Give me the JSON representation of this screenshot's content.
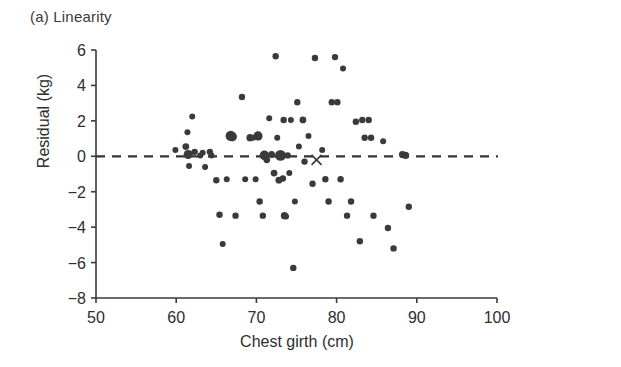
{
  "figure": {
    "panel_label": "(a) Linearity",
    "background_color": "#ffffff",
    "ink_color": "#333333"
  },
  "chart_data": {
    "type": "scatter",
    "title": "(a) Linearity",
    "xlabel": "Chest girth (cm)",
    "ylabel": "Residual (kg)",
    "xlim": [
      50,
      100
    ],
    "ylim": [
      -8,
      6
    ],
    "xticks": [
      50,
      60,
      70,
      80,
      90,
      100
    ],
    "yticks": [
      -8,
      -6,
      -4,
      -2,
      0,
      2,
      4,
      6
    ],
    "xtick_labels": [
      "50",
      "60",
      "70",
      "80",
      "90",
      "100"
    ],
    "ytick_labels": [
      "−8",
      "−6",
      "−4",
      "−2",
      "0",
      "2",
      "4",
      "6"
    ],
    "grid": false,
    "legend": null,
    "reference_line": {
      "kind": "horizontal",
      "y": 0,
      "style": "dashed",
      "color": "#333333"
    },
    "marker_color": "#3a3a3a",
    "series": [
      {
        "name": "residuals",
        "marker": "circle",
        "points": [
          {
            "x": 59.9,
            "y": 0.35,
            "size": 3.0
          },
          {
            "x": 61.2,
            "y": 0.55,
            "size": 3.4
          },
          {
            "x": 61.4,
            "y": 1.35,
            "size": 3.0
          },
          {
            "x": 61.5,
            "y": 0.1,
            "size": 4.6
          },
          {
            "x": 61.6,
            "y": -0.55,
            "size": 3.0
          },
          {
            "x": 62.0,
            "y": 2.25,
            "size": 3.0
          },
          {
            "x": 62.3,
            "y": 0.25,
            "size": 3.2
          },
          {
            "x": 63.0,
            "y": 0.05,
            "size": 3.0
          },
          {
            "x": 63.3,
            "y": 0.2,
            "size": 3.0
          },
          {
            "x": 63.6,
            "y": -0.6,
            "size": 3.0
          },
          {
            "x": 64.2,
            "y": 0.25,
            "size": 3.2
          },
          {
            "x": 64.4,
            "y": 0.05,
            "size": 3.0
          },
          {
            "x": 65.0,
            "y": -1.35,
            "size": 3.2
          },
          {
            "x": 65.4,
            "y": -3.3,
            "size": 3.2
          },
          {
            "x": 65.8,
            "y": -4.95,
            "size": 3.0
          },
          {
            "x": 66.3,
            "y": -1.3,
            "size": 3.0
          },
          {
            "x": 66.8,
            "y": 1.15,
            "size": 5.2
          },
          {
            "x": 67.0,
            "y": 1.1,
            "size": 4.6
          },
          {
            "x": 67.4,
            "y": -3.35,
            "size": 3.2
          },
          {
            "x": 68.2,
            "y": 3.35,
            "size": 3.2
          },
          {
            "x": 68.6,
            "y": -1.3,
            "size": 3.0
          },
          {
            "x": 69.2,
            "y": 1.05,
            "size": 3.6
          },
          {
            "x": 69.6,
            "y": 1.05,
            "size": 3.0
          },
          {
            "x": 69.9,
            "y": -1.3,
            "size": 3.0
          },
          {
            "x": 70.2,
            "y": 1.15,
            "size": 4.6
          },
          {
            "x": 70.4,
            "y": -2.55,
            "size": 3.2
          },
          {
            "x": 70.8,
            "y": -3.35,
            "size": 3.2
          },
          {
            "x": 71.0,
            "y": 0.05,
            "size": 4.8
          },
          {
            "x": 71.3,
            "y": -0.2,
            "size": 3.4
          },
          {
            "x": 71.6,
            "y": 2.15,
            "size": 3.0
          },
          {
            "x": 71.9,
            "y": 0.1,
            "size": 3.4
          },
          {
            "x": 72.2,
            "y": -0.95,
            "size": 3.4
          },
          {
            "x": 72.4,
            "y": 5.65,
            "size": 3.2
          },
          {
            "x": 72.6,
            "y": 1.05,
            "size": 3.0
          },
          {
            "x": 72.8,
            "y": -1.35,
            "size": 3.4
          },
          {
            "x": 73.0,
            "y": 0.05,
            "size": 5.4
          },
          {
            "x": 73.2,
            "y": 0.05,
            "size": 3.6
          },
          {
            "x": 73.3,
            "y": -1.25,
            "size": 3.2
          },
          {
            "x": 73.4,
            "y": 2.05,
            "size": 3.2
          },
          {
            "x": 73.5,
            "y": -3.35,
            "size": 3.6
          },
          {
            "x": 73.7,
            "y": -3.4,
            "size": 3.0
          },
          {
            "x": 73.9,
            "y": 0.05,
            "size": 3.2
          },
          {
            "x": 74.1,
            "y": -0.95,
            "size": 3.0
          },
          {
            "x": 74.3,
            "y": 2.05,
            "size": 3.0
          },
          {
            "x": 74.6,
            "y": -6.3,
            "size": 3.2
          },
          {
            "x": 74.8,
            "y": -2.55,
            "size": 3.0
          },
          {
            "x": 75.1,
            "y": 3.05,
            "size": 3.2
          },
          {
            "x": 75.3,
            "y": 0.55,
            "size": 3.0
          },
          {
            "x": 75.8,
            "y": 2.05,
            "size": 3.4
          },
          {
            "x": 76.0,
            "y": -0.3,
            "size": 3.2
          },
          {
            "x": 76.5,
            "y": 1.15,
            "size": 3.0
          },
          {
            "x": 77.0,
            "y": -1.55,
            "size": 3.2
          },
          {
            "x": 77.3,
            "y": 5.55,
            "size": 3.2
          },
          {
            "x": 78.2,
            "y": 0.35,
            "size": 3.0
          },
          {
            "x": 78.6,
            "y": -1.3,
            "size": 3.2
          },
          {
            "x": 79.0,
            "y": -2.55,
            "size": 3.2
          },
          {
            "x": 79.4,
            "y": 3.05,
            "size": 3.2
          },
          {
            "x": 79.8,
            "y": 5.6,
            "size": 3.2
          },
          {
            "x": 80.1,
            "y": 3.05,
            "size": 3.2
          },
          {
            "x": 80.5,
            "y": -1.3,
            "size": 3.2
          },
          {
            "x": 80.8,
            "y": 4.95,
            "size": 3.0
          },
          {
            "x": 81.3,
            "y": -3.35,
            "size": 3.2
          },
          {
            "x": 81.8,
            "y": -2.55,
            "size": 3.2
          },
          {
            "x": 82.4,
            "y": 1.95,
            "size": 3.2
          },
          {
            "x": 82.9,
            "y": -4.8,
            "size": 3.2
          },
          {
            "x": 83.2,
            "y": 2.05,
            "size": 3.2
          },
          {
            "x": 83.5,
            "y": 1.05,
            "size": 3.2
          },
          {
            "x": 84.0,
            "y": 2.05,
            "size": 3.2
          },
          {
            "x": 84.3,
            "y": 1.05,
            "size": 3.2
          },
          {
            "x": 84.6,
            "y": -3.35,
            "size": 3.2
          },
          {
            "x": 85.8,
            "y": 0.85,
            "size": 3.0
          },
          {
            "x": 86.4,
            "y": -4.05,
            "size": 3.2
          },
          {
            "x": 87.1,
            "y": -5.2,
            "size": 3.2
          },
          {
            "x": 88.2,
            "y": 0.1,
            "size": 3.4
          },
          {
            "x": 88.6,
            "y": 0.05,
            "size": 3.6
          },
          {
            "x": 89.0,
            "y": -2.85,
            "size": 3.2
          }
        ]
      },
      {
        "name": "highlighted-observation",
        "marker": "x",
        "points": [
          {
            "x": 77.5,
            "y": -0.2,
            "size": 5
          }
        ]
      }
    ]
  }
}
